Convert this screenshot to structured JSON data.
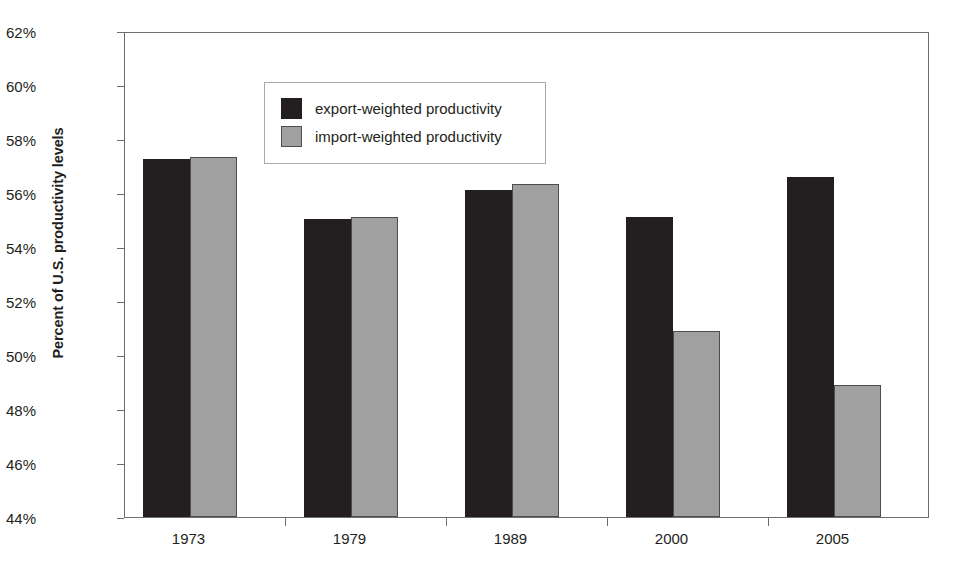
{
  "chart_data": {
    "type": "bar",
    "title": "",
    "xlabel": "",
    "ylabel": "Percent of U.S. productivity levels",
    "categories": [
      "1973",
      "1979",
      "1989",
      "2000",
      "2005"
    ],
    "series": [
      {
        "name": "export-weighted productivity",
        "color": "#231f20",
        "values": [
          57.25,
          55.05,
          56.1,
          55.1,
          56.6
        ]
      },
      {
        "name": "import-weighted productivity",
        "color": "#a0a0a0",
        "values": [
          57.35,
          55.1,
          56.35,
          50.9,
          48.9
        ]
      }
    ],
    "ylim": [
      44,
      62
    ],
    "ytick_step": 2,
    "ytick_labels": [
      "44%",
      "46%",
      "48%",
      "50%",
      "52%",
      "54%",
      "56%",
      "58%",
      "60%",
      "62%"
    ],
    "ytick_values": [
      44,
      46,
      48,
      50,
      52,
      54,
      56,
      58,
      60,
      62
    ],
    "grid": false,
    "legend_position": "top-left",
    "value_suffix": "%"
  },
  "legend": {
    "entries": [
      {
        "label": "export-weighted productivity",
        "swatch": "black-square-swatch"
      },
      {
        "label": "import-weighted productivity",
        "swatch": "gray-square-swatch"
      }
    ]
  },
  "axes": {
    "y_title": "Percent of U.S. productivity levels"
  },
  "colors": {
    "export_bar": "#231f20",
    "import_bar": "#a0a0a0",
    "frame": "#6d6e71",
    "legend_border": "#a7a9ac",
    "text": "#231f20",
    "background": "#ffffff"
  }
}
